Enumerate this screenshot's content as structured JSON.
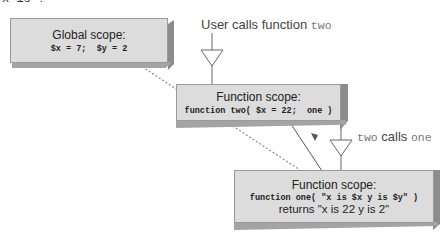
{
  "top_clipped_text": "x is ?",
  "global_scope": {
    "title": "Global scope:",
    "code": "$x = 7;  $y = 2"
  },
  "user_call": {
    "prefix": "User calls function ",
    "func": "two"
  },
  "function_two": {
    "title": "Function scope:",
    "code": "function two( $x = 22;  one )"
  },
  "two_calls_one": {
    "caller": "two",
    "middle": " calls ",
    "callee": "one"
  },
  "function_one": {
    "title": "Function scope:",
    "code": "function one( \"x is $x y is $y\" )",
    "returns": "returns \"x is 22 y is 2\""
  },
  "colors": {
    "box_face": "#dcdcdc",
    "box_side": "#8c8c8c",
    "dotted_line": "#8a8a8a",
    "arrow_line": "#555555"
  }
}
